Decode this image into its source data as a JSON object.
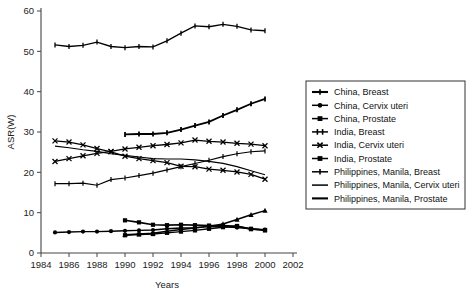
{
  "chart_data": {
    "type": "line",
    "title": "",
    "xlabel": "Years",
    "ylabel": "ASR(W)",
    "xlim": [
      1984,
      2002
    ],
    "ylim": [
      0,
      60
    ],
    "xticks": [
      1984,
      1986,
      1988,
      1990,
      1992,
      1994,
      1996,
      1998,
      2000,
      2002
    ],
    "yticks": [
      0,
      10,
      20,
      30,
      40,
      50,
      60
    ],
    "grid": false,
    "legend_position": "right",
    "series": [
      {
        "name": "China, Breast",
        "marker": "plus",
        "line_weight": 1.2,
        "x": [
          1985,
          1986,
          1987,
          1988,
          1989,
          1990,
          1991,
          1992,
          1993,
          1994,
          1995,
          1996,
          1997,
          1998,
          1999,
          2000
        ],
        "values": [
          17.2,
          17.2,
          17.3,
          16.8,
          18.2,
          18.6,
          19.2,
          19.8,
          20.6,
          21.4,
          22.2,
          23.0,
          23.9,
          24.6,
          25.1,
          25.3
        ]
      },
      {
        "name": "China, Cervix uteri",
        "marker": "circle",
        "line_weight": 1.4,
        "x": [
          1985,
          1986,
          1987,
          1988,
          1989,
          1990,
          1991,
          1992,
          1993,
          1994,
          1995,
          1996,
          1997,
          1998,
          1999,
          2000
        ],
        "values": [
          5.1,
          5.2,
          5.3,
          5.3,
          5.4,
          5.5,
          5.6,
          5.7,
          6.0,
          6.2,
          6.3,
          6.6,
          6.5,
          6.3,
          6.0,
          5.8
        ]
      },
      {
        "name": "China, Prostate",
        "marker": "square",
        "line_weight": 1.4,
        "x": [
          1990,
          1991,
          1992,
          1993,
          1994,
          1995,
          1996,
          1997,
          1998,
          1999,
          2000
        ],
        "values": [
          4.4,
          4.6,
          4.7,
          5.0,
          5.3,
          5.6,
          6.0,
          6.4,
          6.7,
          5.9,
          5.7
        ]
      },
      {
        "name": "India, Breast",
        "marker": "plus",
        "line_weight": 1.8,
        "x": [
          1990,
          1991,
          1992,
          1993,
          1994,
          1995,
          1996,
          1997,
          1998,
          1999,
          2000
        ],
        "values": [
          29.4,
          29.5,
          29.5,
          29.8,
          30.6,
          31.6,
          32.5,
          34.1,
          35.5,
          37.0,
          38.2
        ]
      },
      {
        "name": "India, Cervix uteri",
        "marker": "x",
        "line_weight": 1.3,
        "x": [
          1985,
          1986,
          1987,
          1988,
          1989,
          1990,
          1991,
          1992,
          1993,
          1994,
          1995,
          1996,
          1997,
          1998,
          1999,
          2000
        ],
        "values": [
          27.8,
          27.5,
          26.8,
          25.9,
          25.1,
          24.0,
          23.4,
          22.9,
          22.4,
          21.5,
          21.4,
          20.8,
          20.5,
          20.1,
          19.5,
          18.3
        ]
      },
      {
        "name": "India, Prostate",
        "marker": "square",
        "line_weight": 1.6,
        "x": [
          1990,
          1991,
          1992,
          1993,
          1994,
          1995,
          1996,
          1997,
          1998,
          1999,
          2000
        ],
        "values": [
          8.1,
          7.6,
          7.0,
          6.9,
          7.0,
          6.9,
          6.8,
          6.8,
          6.6,
          6.0,
          5.6
        ]
      },
      {
        "name": "Philippines, Manila, Breast",
        "marker": "plus",
        "line_weight": 1.3,
        "x": [
          1985,
          1986,
          1987,
          1988,
          1989,
          1990,
          1991,
          1992,
          1993,
          1994,
          1995,
          1996,
          1997,
          1998,
          1999,
          2000
        ],
        "values": [
          51.6,
          51.2,
          51.5,
          52.3,
          51.2,
          50.9,
          51.2,
          51.1,
          52.6,
          54.5,
          56.3,
          56.1,
          56.7,
          56.2,
          55.3,
          55.1
        ]
      },
      {
        "name": "Philippines, Manila, Cervix uteri",
        "marker": "none",
        "line_weight": 1.2,
        "x": [
          1985,
          1986,
          1987,
          1988,
          1989,
          1990,
          1991,
          1992,
          1993,
          1994,
          1995,
          1996,
          1997,
          1998,
          1999,
          2000
        ],
        "values": [
          26.5,
          26.1,
          25.6,
          25.2,
          24.6,
          24.2,
          23.8,
          23.4,
          23.3,
          23.3,
          23.1,
          22.7,
          22.2,
          21.4,
          20.4,
          19.4
        ]
      },
      {
        "name": "Philippines, Manila, Prostate",
        "marker": "triangle",
        "line_weight": 1.5,
        "x": [
          1990,
          1991,
          1992,
          1993,
          1994,
          1995,
          1996,
          1997,
          1998,
          1999,
          2000
        ],
        "values": [
          4.5,
          4.7,
          4.9,
          5.4,
          5.8,
          6.2,
          6.6,
          7.2,
          8.3,
          9.5,
          10.5
        ]
      },
      {
        "name": "India, Breast (lower)",
        "marker": "x",
        "line_weight": 1.3,
        "x": [
          1985,
          1986,
          1987,
          1988,
          1989,
          1990,
          1991,
          1992,
          1993,
          1994,
          1995,
          1996,
          1997,
          1998,
          1999,
          2000
        ],
        "values": [
          22.7,
          23.4,
          24.1,
          24.7,
          25.2,
          25.8,
          26.2,
          26.6,
          26.9,
          27.3,
          28.0,
          27.7,
          27.5,
          27.2,
          27.0,
          26.6
        ]
      }
    ]
  },
  "legend": {
    "entries": [
      {
        "label": "China, Breast",
        "marker": "plus-bold"
      },
      {
        "label": "China, Cervix uteri",
        "marker": "circle"
      },
      {
        "label": "China, Prostate",
        "marker": "square"
      },
      {
        "label": "India, Breast",
        "marker": "plus-double"
      },
      {
        "label": "India, Cervix uteri",
        "marker": "x"
      },
      {
        "label": "India, Prostate",
        "marker": "square"
      },
      {
        "label": "Philippines, Manila, Breast",
        "marker": "plus"
      },
      {
        "label": "Philippines, Manila, Cervix uteri",
        "marker": "line"
      },
      {
        "label": "Philippines, Manila, Prostate",
        "marker": "line-bold"
      }
    ]
  },
  "colors": {
    "ink": "#000000",
    "axis": "#444444",
    "background": "#ffffff"
  }
}
